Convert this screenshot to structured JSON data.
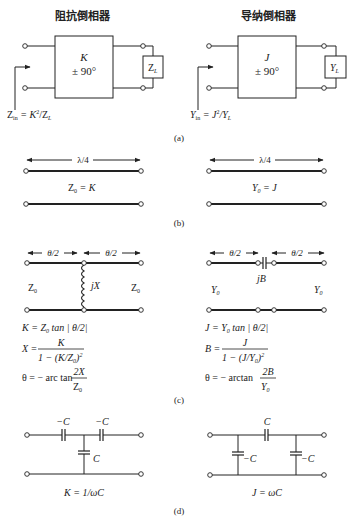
{
  "panel_a": {
    "label": "(a)",
    "impedance_inverter": {
      "title": "阻抗倒相器",
      "box_param": "K",
      "box_phase": "± 90°",
      "load": "Z",
      "load_sub": "L",
      "input_lhs": "Z",
      "input_lhs_sub": "in",
      "input_eq": " = K",
      "input_sup": "2",
      "input_rhs": "/Z",
      "input_rhs_sub": "L"
    },
    "admittance_inverter": {
      "title": "导纳倒相器",
      "box_param": "J",
      "box_phase": "± 90°",
      "load": "Y",
      "load_sub": "L",
      "input_lhs": "Y",
      "input_lhs_sub": "in",
      "input_eq": " = J",
      "input_sup": "2",
      "input_rhs": "/Y",
      "input_rhs_sub": "L"
    }
  },
  "panel_b": {
    "label": "(b)",
    "left": {
      "length": "λ/4",
      "z_sym": "Z",
      "z_sub": "0",
      "z_val": " = K"
    },
    "right": {
      "length": "λ/4",
      "z_sym": "Y",
      "z_sub": "0",
      "z_val": " = J"
    }
  },
  "panel_c": {
    "label": "(c)",
    "left": {
      "half_len": "θ/2",
      "port": "Z",
      "port_sub": "0",
      "element": "jX",
      "eq1": "K = Z",
      "eq1_sub": "0",
      "eq1_tail": " tan | θ/2|",
      "eq2_lhs": "X =",
      "eq2_num": "K",
      "eq2_den": "1 − (K/Z",
      "eq2_den_sub": "0",
      "eq2_den_tail": ")",
      "eq2_den_sup": "2",
      "eq3_lhs": "θ = − arc tan",
      "eq3_num": "2X",
      "eq3_den": "Z",
      "eq3_den_sub": "0"
    },
    "right": {
      "half_len": "θ/2",
      "port": "Y",
      "port_sub": "0",
      "element": "jB",
      "eq1": "J = Y",
      "eq1_sub": "0",
      "eq1_tail": " tan | θ/2|",
      "eq2_lhs": "B =",
      "eq2_num": "J",
      "eq2_den": "1 − (J/Y",
      "eq2_den_sub": "0",
      "eq2_den_tail": ")",
      "eq2_den_sup": "2",
      "eq3_lhs": "θ = − arctan",
      "eq3_num": "2B",
      "eq3_den": "Y",
      "eq3_den_sub": "0"
    }
  },
  "panel_d": {
    "label": "(d)",
    "left": {
      "series_cap": "−C",
      "shunt_cap": "C",
      "relation": "K = 1/ωC"
    },
    "right": {
      "series_cap": "C",
      "shunt_cap": "−C",
      "relation": "J = ωC"
    }
  }
}
